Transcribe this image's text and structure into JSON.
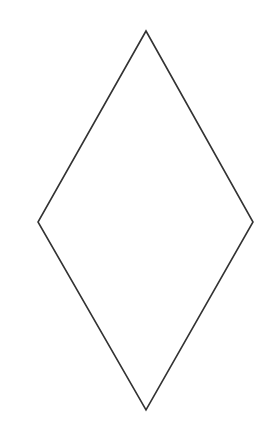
{
  "shape": {
    "type": "rhombus",
    "vertices": {
      "top": [
        146,
        31
      ],
      "right": [
        253,
        222
      ],
      "bottom": [
        146,
        410
      ],
      "left": [
        38,
        222
      ]
    },
    "stroke": "#333333",
    "stroke_width": 1.6,
    "fill": "none"
  },
  "background": "#ffffff"
}
